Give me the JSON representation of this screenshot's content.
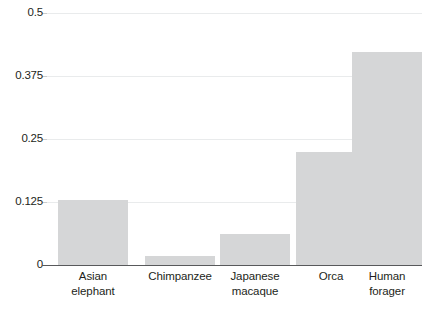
{
  "chart_data": {
    "type": "bar",
    "title": "",
    "subtitle": "",
    "xlabel": "",
    "ylabel": "",
    "categories": [
      "Asian elephant",
      "Chimpanzee",
      "Japanese macaque",
      "Orca",
      "Human forager"
    ],
    "category_lines": [
      [
        "Asian",
        "elephant"
      ],
      [
        "Chimpanzee"
      ],
      [
        "Japanese",
        "macaque"
      ],
      [
        "Orca"
      ],
      [
        "Human",
        "forager"
      ]
    ],
    "values": [
      0.129,
      0.017,
      0.061,
      0.224,
      0.423
    ],
    "ylim": [
      0,
      0.5
    ],
    "yticks": [
      0,
      0.125,
      0.25,
      0.375,
      0.5
    ],
    "ytick_labels": [
      "0",
      "0.125",
      "0.25",
      "0.375",
      "0.5"
    ],
    "grid": true,
    "legend": "none",
    "bar_color": "#d5d6d7",
    "axis_color": "#58595b",
    "grid_color": "#e9ebec",
    "text_color": "#231f20",
    "background": "#ffffff"
  }
}
